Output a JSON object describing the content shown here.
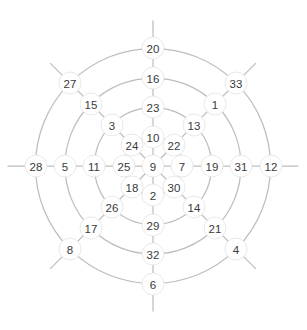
{
  "chart_data": {
    "type": "scatter",
    "title": "",
    "subtitle": "",
    "xlabel": "",
    "ylabel": "",
    "layout": "radial-polar-grid",
    "grid": true,
    "legend": null,
    "center": {
      "id": "center",
      "label": "9",
      "cx": 153,
      "cy": 166,
      "ring": 0,
      "angle_deg": null
    },
    "ring_count": 4,
    "spoke_count": 8,
    "ring_radii": [
      29,
      58.5,
      88,
      117.5
    ],
    "spoke_angles_deg": [
      90,
      45,
      0,
      -45,
      -90,
      -135,
      180,
      135
    ],
    "spoke_names": [
      "N",
      "NE",
      "E",
      "SE",
      "S",
      "SW",
      "W",
      "NW"
    ],
    "spoke_overshoot": 28,
    "colors": {
      "grid_line": "#bdbdbd",
      "node_fill": "#ffffff",
      "node_stroke": "#e2e2e2",
      "label_text": "#3a3a3a",
      "background": "#ffffff"
    },
    "node_radius": 11,
    "rings": [
      {
        "ring": 1,
        "radius": 29,
        "nodes": [
          {
            "label": "10",
            "dir": "N",
            "angle_deg": 90,
            "cx": 153,
            "cy": 137
          },
          {
            "label": "22",
            "dir": "NE",
            "angle_deg": 45,
            "cx": 174,
            "cy": 145
          },
          {
            "label": "7",
            "dir": "E",
            "angle_deg": 0,
            "cx": 182,
            "cy": 166
          },
          {
            "label": "30",
            "dir": "SE",
            "angle_deg": -45,
            "cx": 174,
            "cy": 187
          },
          {
            "label": "2",
            "dir": "S",
            "angle_deg": -90,
            "cx": 153,
            "cy": 195
          },
          {
            "label": "18",
            "dir": "SW",
            "angle_deg": -135,
            "cx": 132,
            "cy": 187
          },
          {
            "label": "25",
            "dir": "W",
            "angle_deg": 180,
            "cx": 124,
            "cy": 166
          },
          {
            "label": "24",
            "dir": "NW",
            "angle_deg": 135,
            "cx": 132,
            "cy": 145
          }
        ]
      },
      {
        "ring": 2,
        "radius": 58.5,
        "nodes": [
          {
            "label": "23",
            "dir": "N",
            "angle_deg": 90,
            "cx": 153,
            "cy": 107
          },
          {
            "label": "13",
            "dir": "NE",
            "angle_deg": 45,
            "cx": 194,
            "cy": 125
          },
          {
            "label": "19",
            "dir": "E",
            "angle_deg": 0,
            "cx": 212,
            "cy": 166
          },
          {
            "label": "14",
            "dir": "SE",
            "angle_deg": -45,
            "cx": 194,
            "cy": 207
          },
          {
            "label": "29",
            "dir": "S",
            "angle_deg": -90,
            "cx": 153,
            "cy": 225
          },
          {
            "label": "26",
            "dir": "SW",
            "angle_deg": -135,
            "cx": 112,
            "cy": 207
          },
          {
            "label": "11",
            "dir": "W",
            "angle_deg": 180,
            "cx": 94,
            "cy": 166
          },
          {
            "label": "3",
            "dir": "NW",
            "angle_deg": 135,
            "cx": 112,
            "cy": 125
          }
        ]
      },
      {
        "ring": 3,
        "radius": 88,
        "nodes": [
          {
            "label": "16",
            "dir": "N",
            "angle_deg": 90,
            "cx": 153,
            "cy": 78
          },
          {
            "label": "1",
            "dir": "NE",
            "angle_deg": 45,
            "cx": 215,
            "cy": 104
          },
          {
            "label": "31",
            "dir": "E",
            "angle_deg": 0,
            "cx": 241,
            "cy": 166
          },
          {
            "label": "21",
            "dir": "SE",
            "angle_deg": -45,
            "cx": 215,
            "cy": 228
          },
          {
            "label": "32",
            "dir": "S",
            "angle_deg": -90,
            "cx": 153,
            "cy": 254
          },
          {
            "label": "17",
            "dir": "SW",
            "angle_deg": -135,
            "cx": 91,
            "cy": 228
          },
          {
            "label": "5",
            "dir": "W",
            "angle_deg": 180,
            "cx": 65,
            "cy": 166
          },
          {
            "label": "15",
            "dir": "NW",
            "angle_deg": 135,
            "cx": 91,
            "cy": 104
          }
        ]
      },
      {
        "ring": 4,
        "radius": 117.5,
        "nodes": [
          {
            "label": "20",
            "dir": "N",
            "angle_deg": 90,
            "cx": 153,
            "cy": 48
          },
          {
            "label": "33",
            "dir": "NE",
            "angle_deg": 45,
            "cx": 236,
            "cy": 83
          },
          {
            "label": "12",
            "dir": "E",
            "angle_deg": 0,
            "cx": 271,
            "cy": 166
          },
          {
            "label": "4",
            "dir": "SE",
            "angle_deg": -45,
            "cx": 236,
            "cy": 249
          },
          {
            "label": "6",
            "dir": "S",
            "angle_deg": -90,
            "cx": 153,
            "cy": 284
          },
          {
            "label": "8",
            "dir": "SW",
            "angle_deg": -135,
            "cx": 70,
            "cy": 249
          },
          {
            "label": "28",
            "dir": "W",
            "angle_deg": 180,
            "cx": 36,
            "cy": 166
          },
          {
            "label": "27",
            "dir": "NW",
            "angle_deg": 135,
            "cx": 70,
            "cy": 83
          }
        ]
      }
    ],
    "all_node_labels": [
      "9",
      "10",
      "22",
      "7",
      "30",
      "2",
      "18",
      "25",
      "24",
      "23",
      "13",
      "19",
      "14",
      "29",
      "26",
      "11",
      "3",
      "16",
      "1",
      "31",
      "21",
      "32",
      "17",
      "5",
      "15",
      "20",
      "33",
      "12",
      "4",
      "6",
      "8",
      "28",
      "27"
    ]
  }
}
